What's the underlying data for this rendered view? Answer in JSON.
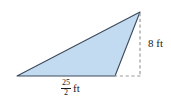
{
  "figure": {
    "type": "geometry-diagram",
    "shape": "triangle",
    "background_color": "#ffffff",
    "fill_color": "#c3dbf1",
    "stroke_color": "#3d4a5c",
    "dashed_color": "#9a9a9a",
    "vertices": {
      "left": [
        17,
        76
      ],
      "bottom_right": [
        115,
        76
      ],
      "apex": [
        140,
        12
      ]
    },
    "labels": {
      "height": {
        "value": "8",
        "unit": "ft",
        "text": "8 ft"
      },
      "base": {
        "numerator": "25",
        "denominator": "2",
        "unit": "ft",
        "text": "25/2 ft"
      }
    },
    "guides": {
      "vertical_dashed": {
        "from": [
          140,
          12
        ],
        "to": [
          140,
          76
        ],
        "meaning": "height"
      },
      "horizontal_dashed": {
        "from": [
          115,
          76
        ],
        "to": [
          140,
          76
        ],
        "meaning": "base-extension"
      }
    }
  }
}
